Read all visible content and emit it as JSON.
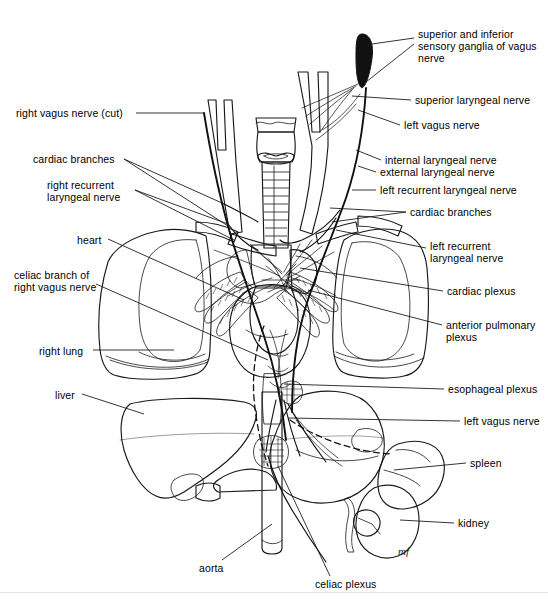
{
  "figure": {
    "signature": "mf",
    "footer_note": ""
  },
  "palette": {
    "background": "#ffffff",
    "outline": "#1a1a1a",
    "lung": "#d2d2d2",
    "lung_shadow": "#bdbdbd",
    "heart": "#8c8c8c",
    "liver": "#a8a8a8",
    "stomach": "#c6c6c6",
    "spleen": "#7a7a7a",
    "kidney": "#5e5e5e",
    "nerve": "#9a9a9a",
    "trachea": "#bfbfbf",
    "aorta": "#a5a5a5",
    "ganglion": "#111111",
    "leader": "#111111"
  },
  "labels": {
    "left": [
      {
        "id": "right-vagus-nerve-cut",
        "text": "right vagus nerve (cut)",
        "x": 16,
        "y": 109,
        "align": "left"
      },
      {
        "id": "cardiac-branches-left",
        "text": "cardiac branches",
        "x": 33,
        "y": 155,
        "align": "left"
      },
      {
        "id": "right-recurrent-laryngeal-nerve",
        "text": "right recurrent\nlaryngeal nerve",
        "x": 47,
        "y": 181,
        "align": "left"
      },
      {
        "id": "heart",
        "text": "heart",
        "x": 77,
        "y": 236,
        "align": "left"
      },
      {
        "id": "celiac-branch-of-right-vagus-nerve",
        "text": "celiac branch of\nright vagus nerve",
        "x": 14,
        "y": 271,
        "align": "left"
      },
      {
        "id": "right-lung",
        "text": "right lung",
        "x": 39,
        "y": 347,
        "align": "left"
      },
      {
        "id": "liver",
        "text": "liver",
        "x": 55,
        "y": 391,
        "align": "left"
      }
    ],
    "right": [
      {
        "id": "superior-and-inferior-sensory-ganglia",
        "text": "superior and inferior\nsensory ganglia of vagus\nnerve",
        "x": 418,
        "y": 30,
        "align": "left"
      },
      {
        "id": "superior-laryngeal-nerve",
        "text": "superior laryngeal nerve",
        "x": 415,
        "y": 96,
        "align": "left"
      },
      {
        "id": "left-vagus-nerve-top",
        "text": "left vagus nerve",
        "x": 404,
        "y": 121,
        "align": "left"
      },
      {
        "id": "internal-laryngeal-nerve",
        "text": "internal laryngeal nerve",
        "x": 385,
        "y": 156,
        "align": "left"
      },
      {
        "id": "external-laryngeal-nerve",
        "text": "external laryngeal nerve",
        "x": 380,
        "y": 168,
        "align": "left"
      },
      {
        "id": "left-recurrent-laryngeal-nerve-top",
        "text": "left recurrent laryngeal nerve",
        "x": 380,
        "y": 186,
        "align": "left"
      },
      {
        "id": "cardiac-branches-right",
        "text": "cardiac branches",
        "x": 410,
        "y": 208,
        "align": "left"
      },
      {
        "id": "left-recurrent-laryngeal-nerve-lower",
        "text": "left recurrent\nlaryngeal nerve",
        "x": 430,
        "y": 242,
        "align": "left"
      },
      {
        "id": "cardiac-plexus",
        "text": "cardiac plexus",
        "x": 447,
        "y": 287,
        "align": "left"
      },
      {
        "id": "anterior-pulmonary-plexus",
        "text": "anterior pulmonary\nplexus",
        "x": 446,
        "y": 321,
        "align": "left"
      },
      {
        "id": "esophageal-plexus",
        "text": "esophageal plexus",
        "x": 448,
        "y": 385,
        "align": "left"
      },
      {
        "id": "left-vagus-nerve-lower",
        "text": "left vagus nerve",
        "x": 464,
        "y": 417,
        "align": "left"
      },
      {
        "id": "spleen",
        "text": "spleen",
        "x": 470,
        "y": 459,
        "align": "left"
      },
      {
        "id": "kidney",
        "text": "kidney",
        "x": 458,
        "y": 519,
        "align": "left"
      }
    ],
    "bottom": [
      {
        "id": "aorta",
        "text": "aorta",
        "x": 199,
        "y": 564,
        "align": "left"
      },
      {
        "id": "celiac-plexus-bottom",
        "text": "celiac plexus",
        "x": 315,
        "y": 580,
        "align": "left"
      }
    ]
  },
  "structures": [
    {
      "id": "right-lung",
      "name": "right lung"
    },
    {
      "id": "left-lung",
      "name": "left lung"
    },
    {
      "id": "heart",
      "name": "heart"
    },
    {
      "id": "liver",
      "name": "liver"
    },
    {
      "id": "stomach",
      "name": "stomach"
    },
    {
      "id": "spleen",
      "name": "spleen"
    },
    {
      "id": "kidney",
      "name": "kidney"
    },
    {
      "id": "aorta",
      "name": "aorta"
    },
    {
      "id": "trachea-larynx",
      "name": "larynx and trachea"
    },
    {
      "id": "vagus-nerve-trunks",
      "name": "vagus nerve trunks"
    },
    {
      "id": "celiac-plexus-ganglion",
      "name": "celiac plexus"
    }
  ]
}
